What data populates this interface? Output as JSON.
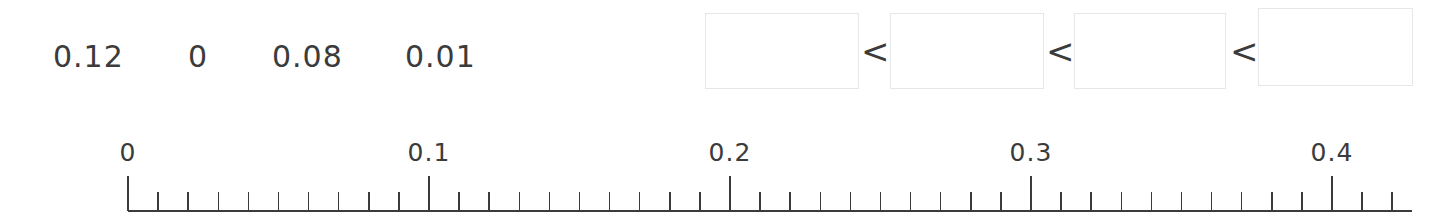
{
  "background_color": "#ffffff",
  "ink_color": "#3b3b3b",
  "box_border_color": "#e6e6e8",
  "task": {
    "tokens": [
      {
        "label": "0.12",
        "x": 53,
        "y": 42
      },
      {
        "label": "0",
        "x": 188,
        "y": 42
      },
      {
        "label": "0.08",
        "x": 272,
        "y": 42
      },
      {
        "label": "0.01",
        "x": 405,
        "y": 42
      }
    ],
    "boxes": [
      {
        "value": "",
        "placeholder": "",
        "x": 705,
        "y": 13,
        "w": 154,
        "h": 76
      },
      {
        "value": "",
        "placeholder": "",
        "x": 890,
        "y": 13,
        "w": 154,
        "h": 76
      },
      {
        "value": "",
        "placeholder": "",
        "x": 1074,
        "y": 13,
        "w": 152,
        "h": 76
      },
      {
        "value": "",
        "placeholder": "",
        "x": 1258,
        "y": 8,
        "w": 155,
        "h": 78
      }
    ],
    "operators": [
      {
        "symbol": "<",
        "x": 861,
        "y": 34
      },
      {
        "symbol": "<",
        "x": 1046,
        "y": 34
      },
      {
        "symbol": "<",
        "x": 1230,
        "y": 34
      }
    ]
  },
  "chart_data": {
    "type": "number-line",
    "title": "",
    "xlabel": "",
    "ylabel": "",
    "axis_min": 0,
    "axis_max": 0.42,
    "major_tick_step": 0.1,
    "minor_tick_step": 0.01,
    "major_ticks": [
      {
        "value": 0,
        "label": "0"
      },
      {
        "value": 0.1,
        "label": "0.1"
      },
      {
        "value": 0.2,
        "label": "0.2"
      },
      {
        "value": 0.3,
        "label": "0.3"
      },
      {
        "value": 0.4,
        "label": "0.4"
      }
    ],
    "tick_labels": [
      "0",
      "0.1",
      "0.2",
      "0.3",
      "0.4"
    ],
    "plotted_points": [],
    "grid": false,
    "legend": null,
    "geometry": {
      "x_start_px": 128,
      "x_end_px": 1412,
      "px_per_unit": 3010,
      "baseline_y_px": 211,
      "major_tick_top_y_px": 176,
      "minor_tick_top_y_px": 192,
      "label_y_px": 140
    }
  }
}
